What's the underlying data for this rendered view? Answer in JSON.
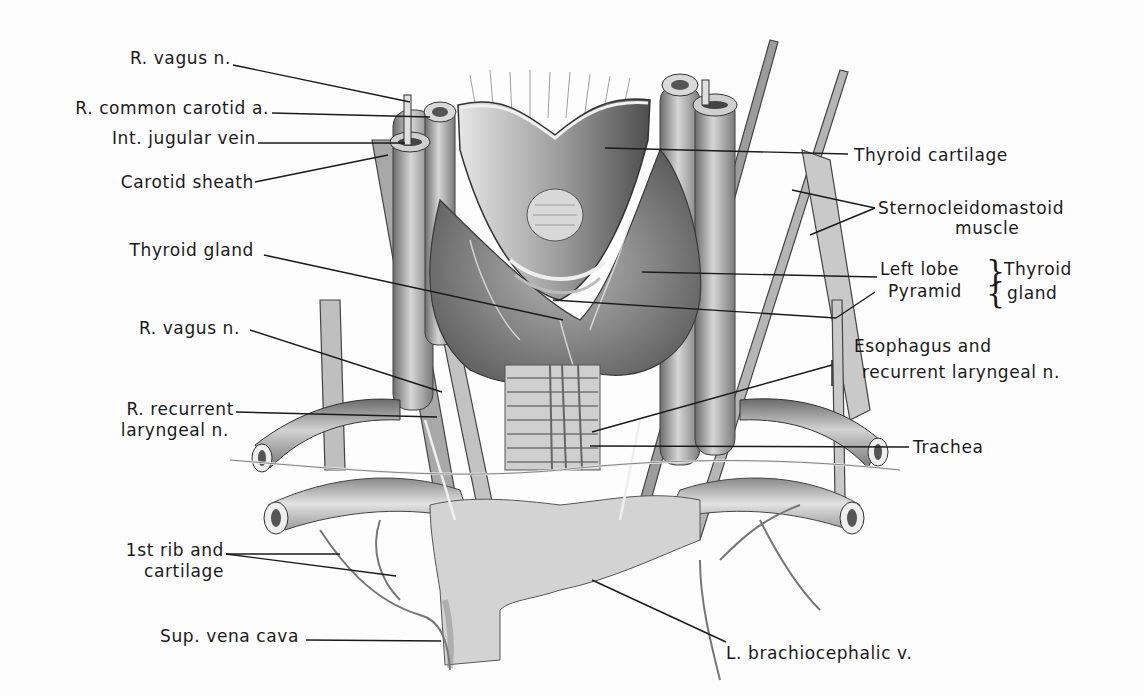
{
  "figure": {
    "style": "grayscale anatomical illustration with leader-line labels"
  },
  "labels_left": [
    {
      "id": "r-vagus-upper",
      "text": "R. vagus n."
    },
    {
      "id": "r-common-carotid",
      "text": "R. common carotid a."
    },
    {
      "id": "int-jugular",
      "text": "Int. jugular vein"
    },
    {
      "id": "carotid-sheath",
      "text": "Carotid sheath"
    },
    {
      "id": "thyroid-gland",
      "text": "Thyroid gland"
    },
    {
      "id": "r-vagus-lower",
      "text": "R. vagus n."
    },
    {
      "id": "r-recurrent-1",
      "text": "R. recurrent"
    },
    {
      "id": "r-recurrent-2",
      "text": "laryngeal n."
    },
    {
      "id": "first-rib-1",
      "text": "1st rib and"
    },
    {
      "id": "first-rib-2",
      "text": "cartilage"
    },
    {
      "id": "svc",
      "text": "Sup. vena cava"
    }
  ],
  "labels_right": [
    {
      "id": "thyroid-cartilage",
      "text": "Thyroid cartilage"
    },
    {
      "id": "scm-1",
      "text": "Sternocleidomastoid"
    },
    {
      "id": "scm-2",
      "text": "muscle"
    },
    {
      "id": "left-lobe",
      "text": "Left lobe"
    },
    {
      "id": "pyramid",
      "text": "Pyramid"
    },
    {
      "id": "thyroid-group-1",
      "text": "Thyroid"
    },
    {
      "id": "thyroid-group-2",
      "text": "gland"
    },
    {
      "id": "esophagus-1",
      "text": "Esophagus and"
    },
    {
      "id": "esophagus-2",
      "text": "recurrent laryngeal n."
    },
    {
      "id": "trachea",
      "text": "Trachea"
    },
    {
      "id": "l-brachiocephalic",
      "text": "L. brachiocephalic v."
    }
  ],
  "colors": {
    "ink": "#1a1a1a",
    "tissue_dark": "#5a5a5a",
    "tissue_mid": "#8e8e8e",
    "tissue_light": "#c9c9c9",
    "background": "#fdfdfd"
  }
}
